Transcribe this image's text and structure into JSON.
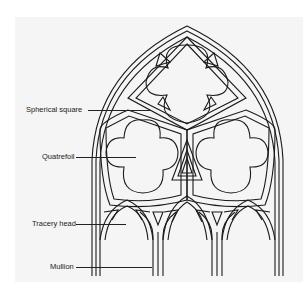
{
  "diagram": {
    "labels": [
      {
        "id": "spherical-square",
        "text": "Spherical square"
      },
      {
        "id": "quatrefoil",
        "text": "Quatrefoil"
      },
      {
        "id": "tracery-head",
        "text": "Tracery head"
      },
      {
        "id": "mullion",
        "text": "Mullion"
      }
    ]
  }
}
